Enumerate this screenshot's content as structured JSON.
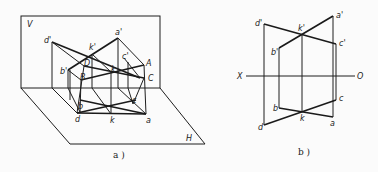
{
  "figure_a": {
    "caption": "a )",
    "plane_labels": {
      "V": "V",
      "H": "H"
    },
    "space_points": {
      "A": "A",
      "B": "B",
      "C": "C",
      "D": "D"
    },
    "v_projections": {
      "a1": "a'",
      "b1": "b'",
      "c1": "c'",
      "d1": "d'",
      "k1": "k'"
    },
    "h_projections": {
      "a": "a",
      "b": "b",
      "c": "c",
      "d": "d",
      "k": "k"
    }
  },
  "figure_b": {
    "caption": "b )",
    "axis": {
      "x": "X",
      "o": "O"
    },
    "v_projections": {
      "a1": "a'",
      "b1": "b'",
      "c1": "c'",
      "d1": "d'",
      "k1": "k'"
    },
    "h_projections": {
      "a": "a",
      "b": "b",
      "c": "c",
      "d": "d",
      "k": "k"
    }
  }
}
